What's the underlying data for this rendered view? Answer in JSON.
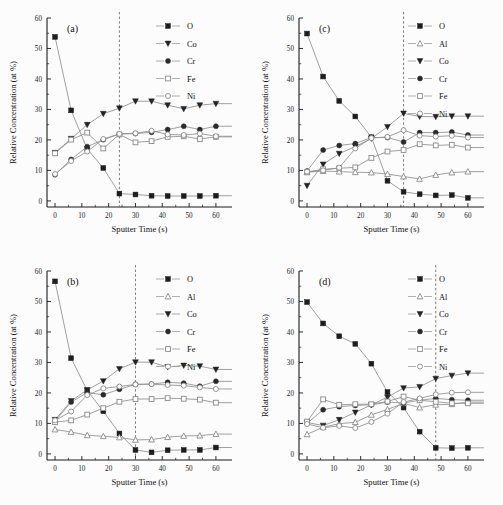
{
  "figure": {
    "axis_x_title": "Sputter Time (s)",
    "axis_y_title": "Relative Concentration (at %)",
    "x_ticks": [
      0,
      10,
      20,
      30,
      40,
      50,
      60
    ],
    "y_ticks": [
      0,
      10,
      20,
      30,
      40,
      50,
      60
    ],
    "xlim": [
      -3,
      66
    ],
    "ylim": [
      -2,
      60
    ]
  },
  "chart_data": [
    {
      "type": "line",
      "panel": "(a)",
      "title": "",
      "xlabel": "Sputter Time (s)",
      "ylabel": "Relative Concentration (at %)",
      "xlim": [
        -3,
        66
      ],
      "ylim": [
        -2,
        60
      ],
      "grid": false,
      "legend_position": "top-right",
      "annotations": [
        {
          "type": "vline",
          "x": 24,
          "style": "dashed"
        }
      ],
      "x": [
        0,
        6,
        12,
        18,
        24,
        30,
        36,
        42,
        48,
        54,
        60
      ],
      "series": [
        {
          "name": "O",
          "marker": "filled-square",
          "values": [
            53.8,
            29.7,
            17.0,
            10.8,
            2.4,
            2.1,
            1.7,
            1.6,
            1.6,
            1.6,
            1.7
          ]
        },
        {
          "name": "Co",
          "marker": "filled-triangle-down",
          "values": [
            15.8,
            20.4,
            25.0,
            28.6,
            30.4,
            32.7,
            32.7,
            31.4,
            30.2,
            31.4,
            31.9
          ]
        },
        {
          "name": "Cr",
          "marker": "filled-circle",
          "values": [
            8.6,
            13.6,
            17.8,
            20.1,
            21.9,
            22.1,
            22.5,
            23.4,
            24.5,
            23.4,
            24.5
          ]
        },
        {
          "name": "Fe",
          "marker": "open-square",
          "values": [
            15.6,
            20.1,
            22.4,
            17.2,
            21.8,
            19.2,
            19.6,
            21.0,
            21.2,
            20.3,
            21.0
          ]
        },
        {
          "name": "Ni",
          "marker": "open-circle",
          "values": [
            8.8,
            13.1,
            16.2,
            20.3,
            22.0,
            22.2,
            23.0,
            21.8,
            21.6,
            22.1,
            21.2
          ]
        }
      ]
    },
    {
      "type": "line",
      "panel": "(b)",
      "title": "",
      "xlabel": "Sputter Time (s)",
      "ylabel": "Relative Concentration (at %)",
      "xlim": [
        -3,
        66
      ],
      "ylim": [
        -2,
        60
      ],
      "grid": false,
      "legend_position": "top-right",
      "annotations": [
        {
          "type": "vline",
          "x": 30,
          "style": "dashed"
        }
      ],
      "x": [
        0,
        6,
        12,
        18,
        24,
        30,
        36,
        42,
        48,
        54,
        60
      ],
      "series": [
        {
          "name": "O",
          "marker": "filled-square",
          "values": [
            56.6,
            31.4,
            20.8,
            14.0,
            6.7,
            1.3,
            0.5,
            1.2,
            1.3,
            1.3,
            2.1
          ]
        },
        {
          "name": "Al",
          "marker": "open-triangle-up",
          "values": [
            8.0,
            7.2,
            6.1,
            5.8,
            5.4,
            4.6,
            4.7,
            5.5,
            5.9,
            6.0,
            6.5
          ]
        },
        {
          "name": "Co",
          "marker": "filled-triangle-down",
          "values": [
            11.2,
            17.4,
            21.0,
            23.9,
            27.9,
            30.1,
            30.1,
            28.5,
            29.0,
            28.8,
            27.7
          ]
        },
        {
          "name": "Cr",
          "marker": "filled-circle",
          "values": [
            10.7,
            17.0,
            20.1,
            19.4,
            21.2,
            22.8,
            22.9,
            23.5,
            23.2,
            22.2,
            23.8
          ]
        },
        {
          "name": "Fe",
          "marker": "open-square",
          "values": [
            10.4,
            11.0,
            12.9,
            15.0,
            17.1,
            18.0,
            18.0,
            18.3,
            18.1,
            17.8,
            16.8
          ]
        },
        {
          "name": "Ni",
          "marker": "open-circle",
          "values": [
            11.0,
            13.9,
            19.3,
            21.5,
            22.1,
            22.8,
            22.9,
            22.6,
            22.4,
            21.8,
            21.3
          ]
        }
      ]
    },
    {
      "type": "line",
      "panel": "(c)",
      "title": "",
      "xlabel": "Sputter Time (s)",
      "ylabel": "Relative Concentration (at %)",
      "xlim": [
        -3,
        66
      ],
      "ylim": [
        -2,
        60
      ],
      "grid": false,
      "legend_position": "top-right",
      "annotations": [
        {
          "type": "vline",
          "x": 36,
          "style": "dashed"
        }
      ],
      "x": [
        0,
        6,
        12,
        18,
        24,
        30,
        36,
        42,
        48,
        54,
        60
      ],
      "series": [
        {
          "name": "O",
          "marker": "filled-square",
          "values": [
            54.9,
            40.8,
            32.8,
            27.7,
            20.9,
            6.6,
            3.0,
            2.2,
            1.8,
            1.9,
            1.0
          ]
        },
        {
          "name": "Al",
          "marker": "open-triangle-up",
          "values": [
            9.4,
            9.8,
            9.6,
            9.4,
            9.3,
            8.8,
            8.0,
            7.2,
            8.5,
            9.3,
            9.6
          ]
        },
        {
          "name": "Co",
          "marker": "filled-triangle-down",
          "values": [
            5.0,
            12.0,
            15.5,
            17.8,
            20.5,
            24.3,
            28.7,
            27.7,
            27.6,
            27.8,
            27.8
          ]
        },
        {
          "name": "Cr",
          "marker": "filled-circle",
          "values": [
            9.8,
            16.7,
            18.2,
            18.8,
            20.8,
            20.8,
            19.3,
            22.4,
            22.4,
            22.6,
            21.6
          ]
        },
        {
          "name": "Fe",
          "marker": "open-square",
          "values": [
            9.4,
            10.4,
            10.7,
            11.0,
            14.1,
            16.2,
            16.7,
            18.6,
            18.2,
            18.4,
            17.5
          ]
        },
        {
          "name": "Ni",
          "marker": "open-circle",
          "values": [
            9.6,
            10.0,
            10.9,
            17.2,
            20.6,
            21.0,
            23.2,
            21.4,
            21.1,
            21.4,
            20.8
          ]
        }
      ]
    },
    {
      "type": "line",
      "panel": "(d)",
      "title": "",
      "xlabel": "Sputter Time (s)",
      "ylabel": "Relative Concentration (at %)",
      "xlim": [
        -3,
        66
      ],
      "ylim": [
        -2,
        60
      ],
      "grid": false,
      "legend_position": "top-right",
      "annotations": [
        {
          "type": "vline",
          "x": 48,
          "style": "dashed"
        }
      ],
      "x": [
        0,
        6,
        12,
        18,
        24,
        30,
        36,
        42,
        48,
        54,
        60
      ],
      "series": [
        {
          "name": "O",
          "marker": "filled-square",
          "values": [
            49.8,
            42.8,
            38.6,
            36.1,
            29.6,
            20.3,
            15.2,
            7.3,
            2.0,
            1.9,
            2.0
          ]
        },
        {
          "name": "Al",
          "marker": "open-triangle-up",
          "values": [
            6.4,
            8.8,
            9.9,
            10.4,
            12.8,
            14.6,
            16.6,
            15.2,
            16.1,
            16.3,
            17.0
          ]
        },
        {
          "name": "Co",
          "marker": "filled-triangle-down",
          "values": [
            10.3,
            9.3,
            11.2,
            13.6,
            16.1,
            18.6,
            21.6,
            22.0,
            24.7,
            25.7,
            26.5
          ]
        },
        {
          "name": "Cr",
          "marker": "filled-circle",
          "values": [
            10.0,
            14.5,
            15.5,
            15.9,
            16.1,
            17.0,
            16.7,
            17.6,
            18.2,
            17.8,
            17.6
          ]
        },
        {
          "name": "Fe",
          "marker": "open-square",
          "values": [
            10.6,
            17.9,
            16.1,
            16.3,
            16.3,
            17.2,
            18.8,
            17.6,
            17.1,
            16.6,
            16.6
          ]
        },
        {
          "name": "Ni",
          "marker": "open-circle",
          "values": [
            9.8,
            8.6,
            9.2,
            8.5,
            10.5,
            13.2,
            17.0,
            18.2,
            19.5,
            20.1,
            20.2
          ]
        }
      ]
    }
  ],
  "panels": {
    "a": {
      "tag": "(a)",
      "legend": [
        "O",
        "Co",
        "Cr",
        "Fe",
        "Ni"
      ]
    },
    "b": {
      "tag": "(b)",
      "legend": [
        "O",
        "Al",
        "Co",
        "Cr",
        "Fe",
        "Ni"
      ]
    },
    "c": {
      "tag": "(c)",
      "legend": [
        "O",
        "Al",
        "Co",
        "Cr",
        "Fe",
        "Ni"
      ]
    },
    "d": {
      "tag": "(d)",
      "legend": [
        "O",
        "Al",
        "Co",
        "Cr",
        "Fe",
        "Ni"
      ]
    }
  }
}
